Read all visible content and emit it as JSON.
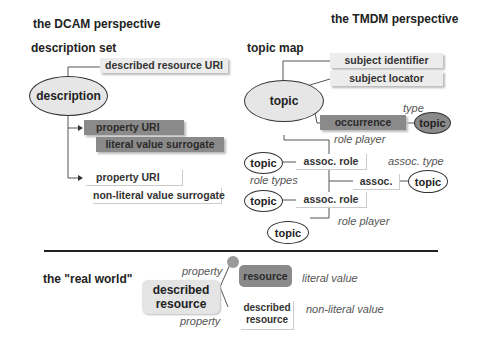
{
  "headings": {
    "dcam": "the DCAM perspective",
    "tmdm": "the TMDM perspective",
    "real_world": "the \"real world\""
  },
  "dcam": {
    "panel_title": "description set",
    "ellipse": "description",
    "described_resource_uri": "described resource URI",
    "property_uri_1": "property URI",
    "literal_value_surrogate": "literal value surrogate",
    "property_uri_2": "property URI",
    "non_literal_value_surrogate": "non-literal value surrogate"
  },
  "tmdm": {
    "panel_title": "topic map",
    "topic_main": "topic",
    "subject_identifier": "subject identifier",
    "subject_locator": "subject locator",
    "occurrence": "occurrence",
    "type_label": "type",
    "topic_type": "topic",
    "role_player_1": "role player",
    "topic_role1": "topic",
    "assoc_role_1": "assoc. role",
    "assoc_type_label": "assoc. type",
    "role_types": "role types",
    "assoc": "assoc.",
    "topic_assoc_type": "topic",
    "topic_role2": "topic",
    "assoc_role_2": "assoc. role",
    "role_player_2": "role player",
    "topic_player": "topic"
  },
  "real_world": {
    "property_top": "property",
    "described_resource": "described resource",
    "property_bottom": "property",
    "resource": "resource",
    "literal_value": "literal value",
    "described_resource_2": "described resource",
    "non_literal_value": "non-literal value"
  },
  "colors": {
    "light_box": "#ececec",
    "dark_box": "#8a8a8a",
    "ellipse_fill": "#e6e6e6",
    "dark_ellipse": "#8a8a8a"
  }
}
